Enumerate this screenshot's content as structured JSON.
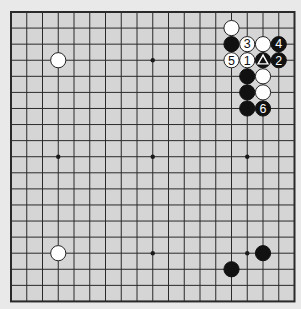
{
  "board": {
    "size": 19,
    "background_color": "#e9e9e9",
    "board_color": "#d5d5d5",
    "line_color": "#2a2a2a",
    "origin": {
      "x": 11,
      "y": 12
    },
    "spacing": {
      "x": 15.75,
      "y": 16.08
    },
    "star_points": [
      [
        3,
        3
      ],
      [
        9,
        3
      ],
      [
        15,
        3
      ],
      [
        3,
        9
      ],
      [
        9,
        9
      ],
      [
        15,
        9
      ],
      [
        3,
        15
      ],
      [
        9,
        15
      ],
      [
        15,
        15
      ]
    ]
  },
  "stones": [
    {
      "color": "white",
      "col": 14,
      "row": 1,
      "label": ""
    },
    {
      "color": "black",
      "col": 14,
      "row": 2,
      "label": ""
    },
    {
      "color": "white",
      "col": 15,
      "row": 2,
      "label": "3"
    },
    {
      "color": "white",
      "col": 16,
      "row": 2,
      "label": ""
    },
    {
      "color": "black",
      "col": 17,
      "row": 2,
      "label": "4"
    },
    {
      "color": "white",
      "col": 14,
      "row": 3,
      "label": "5"
    },
    {
      "color": "white",
      "col": 15,
      "row": 3,
      "label": "1"
    },
    {
      "color": "black",
      "col": 16,
      "row": 3,
      "label": "",
      "marker": "triangle"
    },
    {
      "color": "black",
      "col": 17,
      "row": 3,
      "label": "2"
    },
    {
      "color": "black",
      "col": 15,
      "row": 4,
      "label": ""
    },
    {
      "color": "white",
      "col": 16,
      "row": 4,
      "label": ""
    },
    {
      "color": "black",
      "col": 15,
      "row": 5,
      "label": ""
    },
    {
      "color": "white",
      "col": 16,
      "row": 5,
      "label": ""
    },
    {
      "color": "black",
      "col": 15,
      "row": 6,
      "label": ""
    },
    {
      "color": "black",
      "col": 16,
      "row": 6,
      "label": "6"
    },
    {
      "color": "white",
      "col": 3,
      "row": 3,
      "label": ""
    },
    {
      "color": "white",
      "col": 3,
      "row": 15,
      "label": ""
    },
    {
      "color": "black",
      "col": 16,
      "row": 15,
      "label": ""
    },
    {
      "color": "black",
      "col": 14,
      "row": 16,
      "label": ""
    }
  ]
}
